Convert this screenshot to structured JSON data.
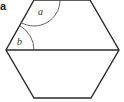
{
  "figure": {
    "part_label": "a",
    "shape": "regular-hexagon",
    "stroke_color": "#2b2b2b",
    "arc_color": "#555555",
    "vertices": [
      [
        34,
        0
      ],
      [
        90,
        0
      ],
      [
        119,
        50
      ],
      [
        91,
        98
      ],
      [
        34,
        98
      ],
      [
        6,
        50
      ]
    ],
    "diagonal": {
      "from": [
        6,
        50
      ],
      "to": [
        119,
        50
      ]
    },
    "angles": [
      {
        "label": "a",
        "vertex": [
          34,
          0
        ],
        "radius": 26
      },
      {
        "label": "b",
        "vertex": [
          6,
          50
        ],
        "radius": 28
      }
    ]
  }
}
